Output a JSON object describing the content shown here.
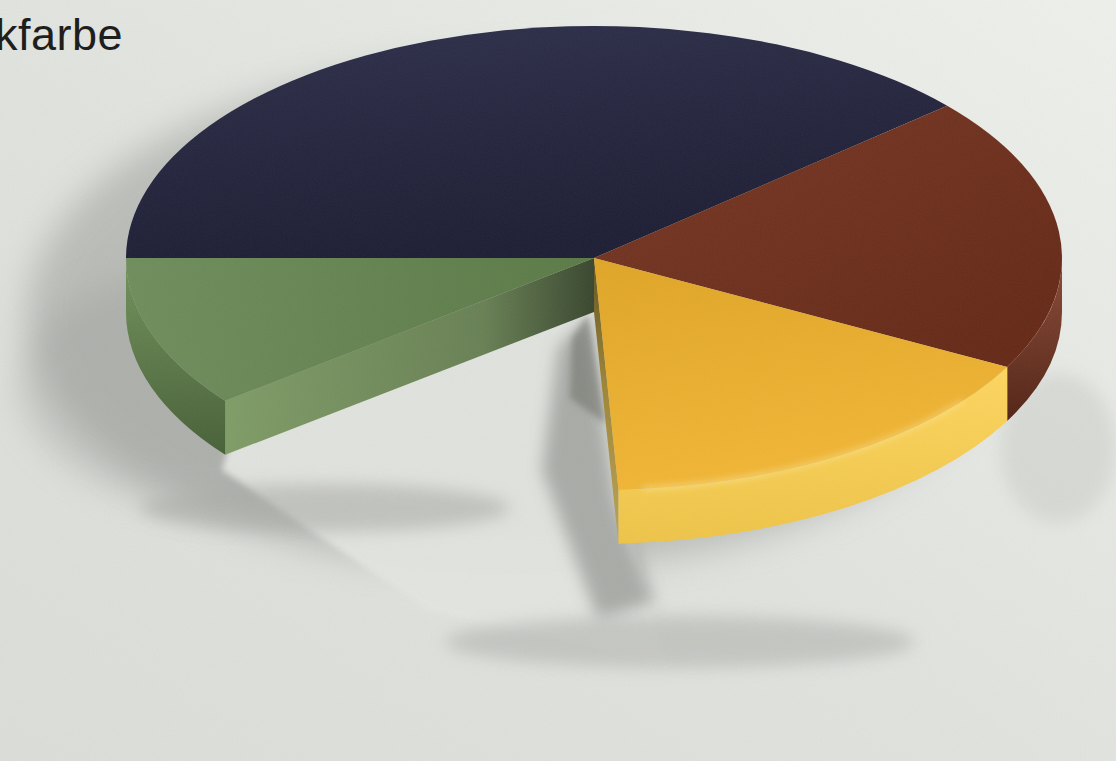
{
  "title": {
    "fragment": "kfarbe",
    "note": "caption text cropped at left image edge; only 'kfarbe' is visible"
  },
  "palette": {
    "background": "#e0e2de",
    "background_highlight": "#eef0ec",
    "cast_shadow": "#a2a4a0",
    "caption_text": "#1e1e1c"
  },
  "chart_data": {
    "type": "pie",
    "presentation": "photographed glossy 3D pie model on light gray surface, one wedge removed, no printed labels or values",
    "title": "kfarbe",
    "legend": "none",
    "axes": "none",
    "segments": [
      {
        "label": "dark-navy",
        "top_color": "#232440",
        "side_color": "#181a2e",
        "cut_color": null,
        "start_deg": 180,
        "end_deg": 319,
        "estimated_percent": 38.6
      },
      {
        "label": "dark-red",
        "top_color": "#6f2b17",
        "side_color": "#7e3620",
        "cut_color": null,
        "start_deg": 319,
        "end_deg": 388,
        "estimated_percent": 19.2
      },
      {
        "label": "yellow",
        "top_color": "#f0b129",
        "side_color": "#fdd04d",
        "cut_color": "#b2973e",
        "start_deg": 28,
        "end_deg": 87,
        "estimated_percent": 16.4
      },
      {
        "label": "green",
        "top_color": "#5f804a",
        "side_color": "#66894e",
        "cut_color": "#7f9c66",
        "start_deg": 142,
        "end_deg": 180,
        "estimated_percent": 10.6
      }
    ],
    "gap_wedge": {
      "label": "removed-wedge",
      "start_deg": 87,
      "end_deg": 142,
      "estimated_percent": 15.2
    }
  }
}
